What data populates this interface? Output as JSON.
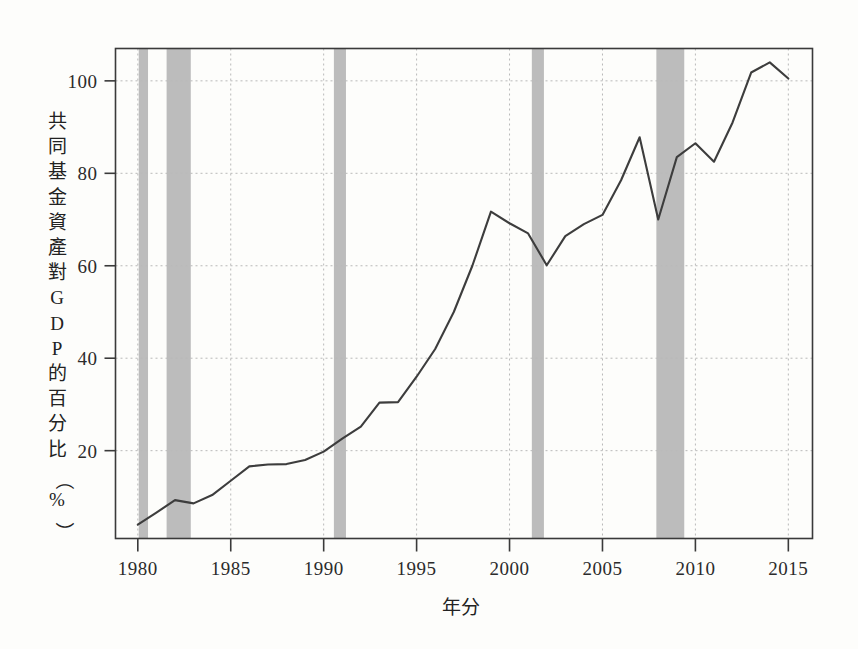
{
  "figure": {
    "background_color": "#fdfdfb",
    "frame_color": "#3a3a3a",
    "line_color": "#3d3d3d",
    "grid_color": "#b9b9b9",
    "band_color": "#b0b0b0",
    "y_axis_title_chars": [
      "共",
      "同",
      "基",
      "金",
      "資",
      "產",
      "對",
      "G",
      "D",
      "P",
      "的",
      "百",
      "分",
      "比",
      "（",
      "%",
      "）"
    ],
    "x_axis_title": "年分"
  },
  "chart_data": {
    "type": "line",
    "title": "",
    "xlabel": "年分",
    "ylabel": "共同基金資產對 G D P 的百分比（%）",
    "xlim": [
      1978.8,
      2016.3
    ],
    "ylim": [
      1.0,
      107.0
    ],
    "xticks": [
      1980,
      1985,
      1990,
      1995,
      2000,
      2005,
      2010,
      2015
    ],
    "xticklabels": [
      "1980",
      "1985",
      "1990",
      "1995",
      "2000",
      "2005",
      "2010",
      "2015"
    ],
    "yticks": [
      20,
      40,
      60,
      80,
      100
    ],
    "yticklabels": [
      "20",
      "40",
      "60",
      "80",
      "100"
    ],
    "grid": true,
    "grid_style": "dotted",
    "legend": "none",
    "x": [
      1980,
      1981,
      1982,
      1983,
      1984,
      1985,
      1986,
      1987,
      1988,
      1989,
      1990,
      1991,
      1992,
      1993,
      1994,
      1995,
      1996,
      1997,
      1998,
      1999,
      2000,
      2001,
      2002,
      2003,
      2004,
      2005,
      2006,
      2007,
      2008,
      2009,
      2010,
      2011,
      2012,
      2013,
      2014,
      2015
    ],
    "values": [
      4.0,
      6.6,
      9.3,
      8.6,
      10.4,
      13.5,
      16.6,
      17.0,
      17.1,
      18.0,
      19.8,
      22.6,
      25.2,
      30.4,
      30.5,
      36.0,
      42.0,
      50.0,
      60.0,
      71.7,
      69.2,
      67.0,
      60.1,
      66.4,
      69.0,
      71.0,
      78.5,
      87.8,
      70.0,
      83.5,
      86.5,
      82.5,
      91.0,
      101.8,
      104.0,
      100.5
    ],
    "series_name": "共同基金資產對GDP的百分比",
    "recession_bands": [
      {
        "start": 1980.05,
        "end": 1980.55
      },
      {
        "start": 1981.55,
        "end": 1982.85
      },
      {
        "start": 1990.55,
        "end": 1991.2
      },
      {
        "start": 2001.2,
        "end": 2001.85
      },
      {
        "start": 2007.9,
        "end": 2009.4
      }
    ]
  }
}
